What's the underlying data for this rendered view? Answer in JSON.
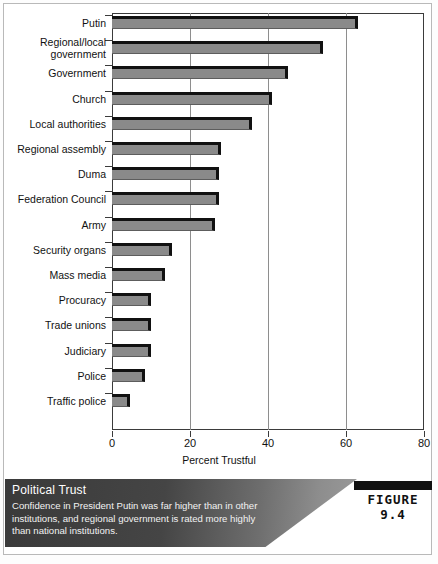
{
  "figure": {
    "badge_label": "FIGURE 9.4",
    "caption_title": "Political Trust",
    "caption_body": "Confidence in President Putin was far higher than in other institutions, and regional government is rated more highly than national institutions."
  },
  "chart_data": {
    "type": "bar",
    "orientation": "horizontal",
    "title": "",
    "xlabel": "Percent Trustful",
    "ylabel": "",
    "xlim": [
      0,
      80
    ],
    "xticks": [
      0,
      20,
      40,
      60,
      80
    ],
    "grid": true,
    "legend": "none",
    "categories": [
      "Putin",
      "Regional/local\ngovernment",
      "Government",
      "Church",
      "Local authorities",
      "Regional assembly",
      "Duma",
      "Federation Council",
      "Army",
      "Security organs",
      "Mass media",
      "Procuracy",
      "Trade unions",
      "Judiciary",
      "Police",
      "Traffic police"
    ],
    "values": [
      63,
      54,
      45,
      41,
      36,
      28,
      27.5,
      27.5,
      26.5,
      15.5,
      13.5,
      10,
      10,
      10,
      8.5,
      4.5
    ],
    "bar_color": "#8a8a8a",
    "bar_edge_color": "#111111"
  }
}
